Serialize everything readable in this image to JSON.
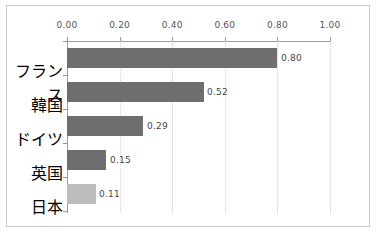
{
  "chart_data": {
    "type": "bar",
    "orientation": "horizontal",
    "title": "",
    "xlabel": "",
    "ylabel": "",
    "categories": [
      "フランス",
      "韓国",
      "ドイツ",
      "英国",
      "日本"
    ],
    "values": [
      0.8,
      0.52,
      0.29,
      0.15,
      0.11
    ],
    "value_labels": [
      "0.80",
      "0.52",
      "0.29",
      "0.15",
      "0.11"
    ],
    "bar_colors": [
      "#6e6e6e",
      "#6e6e6e",
      "#6e6e6e",
      "#6e6e6e",
      "#bcbcbc"
    ],
    "highlight_index": 4,
    "xlim": [
      0.0,
      1.0
    ],
    "xticks": [
      0.0,
      0.2,
      0.4,
      0.6,
      0.8,
      1.0
    ],
    "xtick_labels": [
      "0.00",
      "0.20",
      "0.40",
      "0.60",
      "0.80",
      "1.00"
    ],
    "grid": true,
    "grid_axis": "x",
    "grid_style": "dotted",
    "grid_color": "#d0d0d0",
    "axis_position": "top",
    "legend": false,
    "frame_color": "#c9c9c9",
    "axis_color": "#9a9a9a",
    "text_color": "#444444"
  }
}
